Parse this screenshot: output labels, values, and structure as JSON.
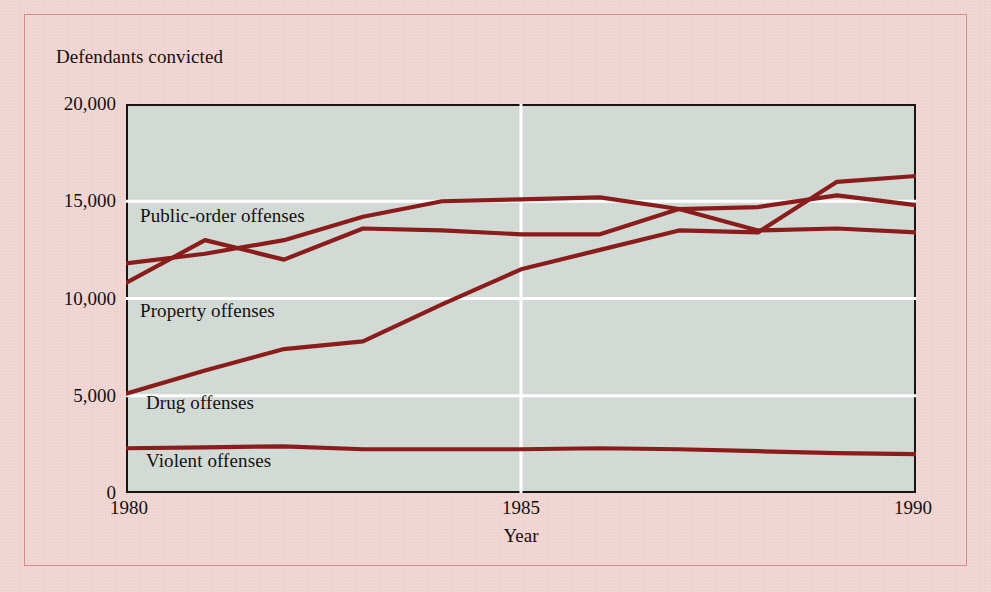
{
  "figure": {
    "title": "Defendants convicted",
    "background_color": "#f1d5d2",
    "plot_background_color": "#d6ded9",
    "border_color": "#d98b86",
    "line_color": "#8a1c1c",
    "gridline_color": "#ffffff"
  },
  "chart_data": {
    "type": "line",
    "title": "Defendants convicted",
    "xlabel": "Year",
    "ylabel": "",
    "x": [
      1980,
      1981,
      1982,
      1983,
      1984,
      1985,
      1986,
      1987,
      1988,
      1989,
      1990
    ],
    "xlim": [
      1980,
      1990
    ],
    "ylim": [
      0,
      20000
    ],
    "xticks": [
      1980,
      1985,
      1990
    ],
    "xtick_labels": [
      "1980",
      "1985",
      "1990"
    ],
    "yticks": [
      0,
      5000,
      10000,
      15000,
      20000
    ],
    "ytick_labels": [
      "0",
      "5,000",
      "10,000",
      "15,000",
      "20,000"
    ],
    "grid": true,
    "grid_axis": "both",
    "legend": "inline-labels",
    "series": [
      {
        "name": "Public-order offenses",
        "label_position": "inline-left-upper",
        "values": [
          11800,
          12300,
          13000,
          14200,
          15000,
          15100,
          15200,
          14600,
          14700,
          15300,
          14800
        ]
      },
      {
        "name": "Property offenses",
        "label_position": "inline-left-middle",
        "values": [
          10800,
          13000,
          12000,
          13600,
          13500,
          13300,
          13300,
          14600,
          13500,
          13600,
          13400
        ]
      },
      {
        "name": "Drug offenses",
        "label_position": "inline-left-lower",
        "values": [
          5100,
          6300,
          7400,
          7800,
          9700,
          11500,
          12500,
          13500,
          13400,
          16000,
          16300
        ]
      },
      {
        "name": "Violent offenses",
        "label_position": "inline-bottom",
        "values": [
          2300,
          2350,
          2400,
          2250,
          2250,
          2250,
          2300,
          2250,
          2150,
          2050,
          2000
        ]
      }
    ]
  }
}
